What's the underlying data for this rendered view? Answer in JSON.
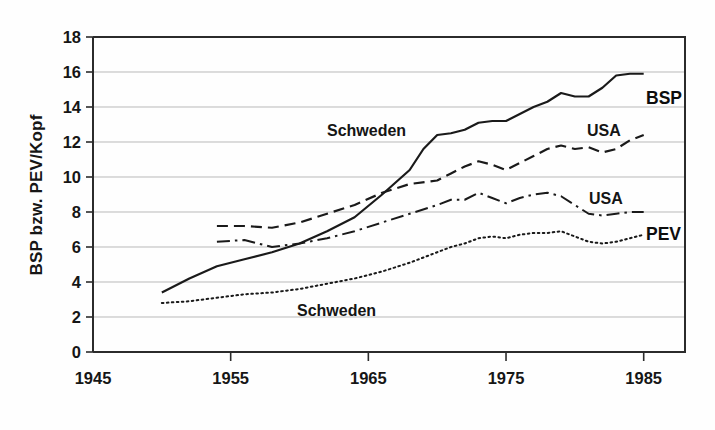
{
  "figure": {
    "background": "#fefefe",
    "ink": "#161616"
  },
  "axes": {
    "y_label": "BSP bzw. PEV/Kopf",
    "y_ticks": [
      "0",
      "2",
      "4",
      "6",
      "8",
      "10",
      "12",
      "14",
      "16",
      "18"
    ],
    "x_ticks": [
      "1945",
      "1955",
      "1965",
      "1975",
      "1985"
    ]
  },
  "annotations": {
    "schweden_bsp": "Schweden",
    "usa_bsp": "USA",
    "usa_pev": "USA",
    "schweden_pev": "Schweden",
    "bsp_group": "BSP",
    "pev_group": "PEV"
  },
  "chart_data": {
    "type": "line",
    "title": "",
    "xlabel": "",
    "ylabel": "BSP bzw. PEV/Kopf",
    "xlim": [
      1945,
      1988
    ],
    "ylim": [
      0,
      18
    ],
    "xticks": [
      1945,
      1955,
      1965,
      1975,
      1985
    ],
    "yticks": [
      0,
      2,
      4,
      6,
      8,
      10,
      12,
      14,
      16,
      18
    ],
    "grid": "horizontal",
    "legend": "inline-annotations",
    "series": [
      {
        "name": "Schweden BSP",
        "group": "BSP",
        "style": "solid",
        "color": "#1a1a1a",
        "x": [
          1950,
          1952,
          1954,
          1956,
          1958,
          1960,
          1962,
          1964,
          1966,
          1968,
          1969,
          1970,
          1971,
          1972,
          1973,
          1974,
          1975,
          1976,
          1977,
          1978,
          1979,
          1980,
          1981,
          1982,
          1983,
          1984,
          1985
        ],
        "y": [
          3.4,
          4.2,
          4.9,
          5.3,
          5.7,
          6.2,
          6.9,
          7.7,
          9.0,
          10.4,
          11.6,
          12.4,
          12.5,
          12.7,
          13.1,
          13.2,
          13.2,
          13.6,
          14.0,
          14.3,
          14.8,
          14.6,
          14.6,
          15.1,
          15.8,
          15.9,
          15.9
        ]
      },
      {
        "name": "USA BSP",
        "group": "BSP",
        "style": "dashed",
        "color": "#1a1a1a",
        "x": [
          1954,
          1956,
          1958,
          1960,
          1962,
          1964,
          1966,
          1968,
          1970,
          1971,
          1972,
          1973,
          1974,
          1975,
          1976,
          1977,
          1978,
          1979,
          1980,
          1981,
          1982,
          1983,
          1984,
          1985
        ],
        "y": [
          7.2,
          7.2,
          7.1,
          7.4,
          7.9,
          8.4,
          9.1,
          9.6,
          9.8,
          10.2,
          10.6,
          10.9,
          10.7,
          10.4,
          10.8,
          11.2,
          11.6,
          11.8,
          11.6,
          11.7,
          11.4,
          11.6,
          12.1,
          12.4
        ]
      },
      {
        "name": "USA PEV",
        "group": "PEV",
        "style": "dash-dot",
        "color": "#1a1a1a",
        "x": [
          1954,
          1956,
          1958,
          1960,
          1962,
          1964,
          1966,
          1968,
          1970,
          1971,
          1972,
          1973,
          1974,
          1975,
          1976,
          1977,
          1978,
          1979,
          1980,
          1981,
          1982,
          1983,
          1984,
          1985
        ],
        "y": [
          6.3,
          6.4,
          6.0,
          6.2,
          6.5,
          6.9,
          7.4,
          7.9,
          8.4,
          8.7,
          8.7,
          9.1,
          8.8,
          8.5,
          8.8,
          9.0,
          9.1,
          8.9,
          8.4,
          7.9,
          7.8,
          7.9,
          8.0,
          8.0
        ]
      },
      {
        "name": "Schweden PEV",
        "group": "PEV",
        "style": "dotted",
        "color": "#1a1a1a",
        "x": [
          1950,
          1952,
          1954,
          1956,
          1958,
          1960,
          1962,
          1964,
          1966,
          1968,
          1970,
          1971,
          1972,
          1973,
          1974,
          1975,
          1976,
          1977,
          1978,
          1979,
          1980,
          1981,
          1982,
          1983,
          1984,
          1985
        ],
        "y": [
          2.8,
          2.9,
          3.1,
          3.3,
          3.4,
          3.6,
          3.9,
          4.2,
          4.6,
          5.1,
          5.7,
          6.0,
          6.2,
          6.5,
          6.6,
          6.5,
          6.7,
          6.8,
          6.8,
          6.9,
          6.6,
          6.3,
          6.2,
          6.3,
          6.5,
          6.7
        ]
      }
    ]
  }
}
